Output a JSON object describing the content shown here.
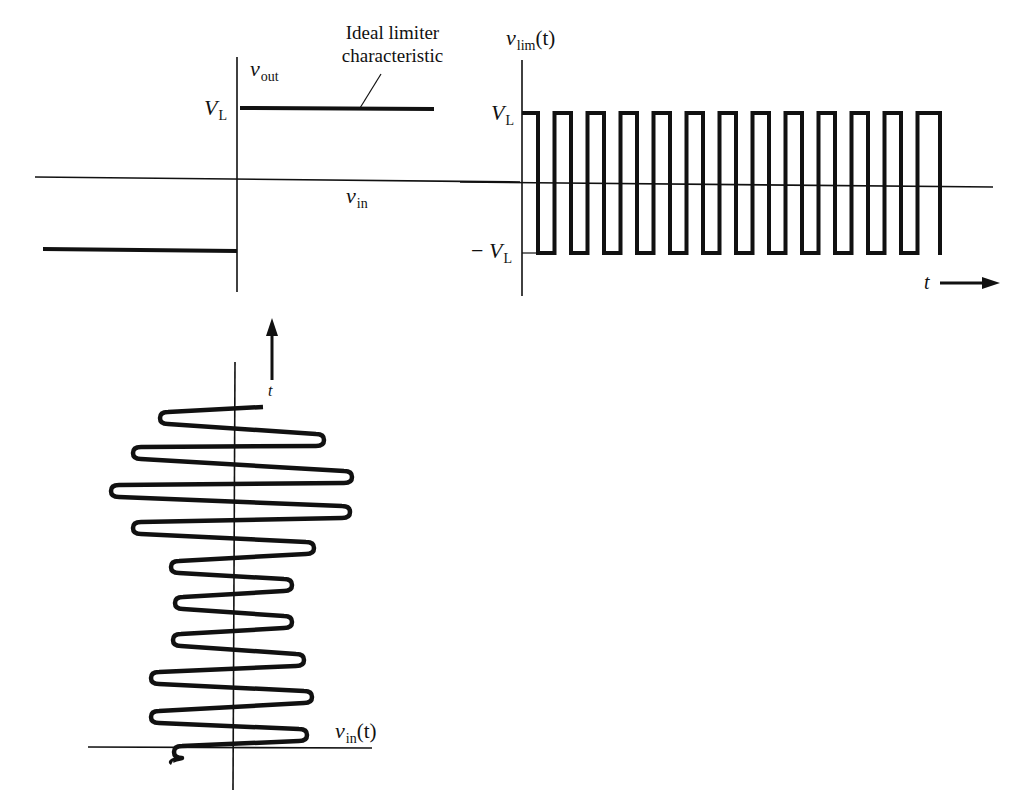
{
  "figure": {
    "colors": {
      "ink": "#111111",
      "background": "#ffffff"
    }
  },
  "characteristic": {
    "annotation_line1": "Ideal limiter",
    "annotation_line2": "characteristic",
    "y_axis_label_main": "v",
    "y_axis_label_sub": "out",
    "x_axis_label_main": "v",
    "x_axis_label_sub": "in",
    "level_label_main": "V",
    "level_label_sub": "L",
    "geometry": {
      "v_axis": [
        237,
        57,
        237,
        292
      ],
      "h_axis": [
        35,
        177,
        520,
        182
      ],
      "upper_limit": [
        240,
        108,
        434,
        109
      ],
      "lower_limit": [
        43,
        249,
        237,
        251
      ],
      "leader": [
        381,
        74,
        360,
        108
      ]
    }
  },
  "limited_output": {
    "y_axis_label_main": "v",
    "y_axis_label_sub": "lim",
    "y_axis_label_arg": "(t)",
    "pos_level_main": "V",
    "pos_level_sub": "L",
    "neg_level_prefix": "− ",
    "neg_level_main": "V",
    "neg_level_sub": "L",
    "time_label": "t",
    "geometry": {
      "v_axis": [
        522,
        60,
        522,
        296
      ],
      "h_axis": [
        460,
        182,
        993,
        187
      ],
      "top_y": 113,
      "bottom_y": 253,
      "start_x": 522,
      "first_fall_x": 538,
      "period": 33.3,
      "pulse_width": 16.5,
      "pulse_count": 12,
      "end_x": 940,
      "time_arrow": [
        940,
        283,
        1000,
        283
      ]
    }
  },
  "input_signal": {
    "label_main": "v",
    "label_sub": "in",
    "label_arg": "(t)",
    "time_label": "t",
    "geometry": {
      "v_axis": [
        235,
        362,
        233,
        790
      ],
      "h_axis": [
        88,
        747,
        372,
        748
      ],
      "time_arrow": [
        272,
        380,
        272,
        318
      ],
      "turning_points": [
        [
          263,
          407
        ],
        [
          162,
          418
        ],
        [
          322,
          440
        ],
        [
          135,
          453
        ],
        [
          350,
          477
        ],
        [
          113,
          491
        ],
        [
          348,
          512
        ],
        [
          135,
          528
        ],
        [
          312,
          548
        ],
        [
          173,
          567
        ],
        [
          290,
          585
        ],
        [
          177,
          603
        ],
        [
          290,
          622
        ],
        [
          175,
          640
        ],
        [
          302,
          660
        ],
        [
          153,
          678
        ],
        [
          310,
          697
        ],
        [
          153,
          717
        ],
        [
          305,
          735
        ],
        [
          176,
          752
        ]
      ],
      "tail_end": [
        172,
        763
      ]
    }
  }
}
